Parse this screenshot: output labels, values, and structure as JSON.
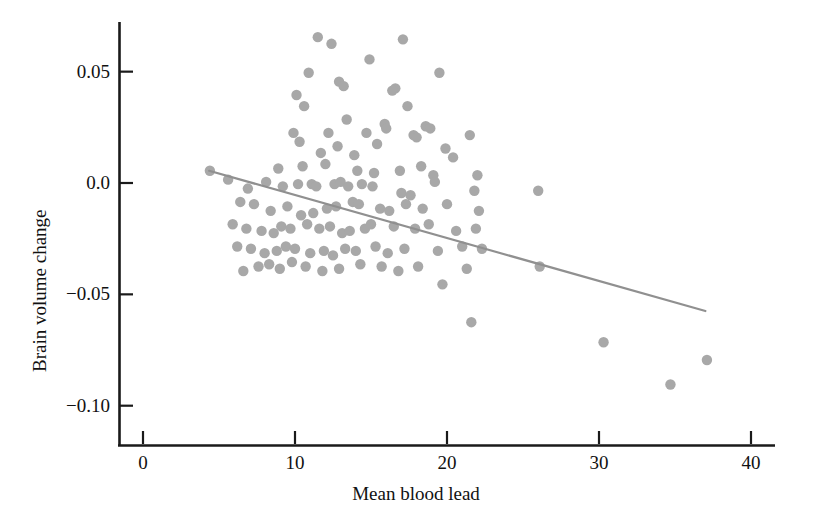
{
  "chart_data": {
    "type": "scatter",
    "title": "",
    "xlabel": "Mean blood lead",
    "ylabel": "Brain volume change",
    "xlim": [
      -1.5,
      42.5
    ],
    "ylim": [
      -0.112,
      0.072
    ],
    "xticks": [
      0,
      10,
      20,
      30,
      40
    ],
    "xtick_labels": [
      "0",
      "10",
      "20",
      "30",
      "40"
    ],
    "yticks": [
      0.05,
      0.0,
      -0.05,
      -0.1
    ],
    "ytick_labels": [
      "0.05",
      "0.0",
      "−0.05",
      "−0.10"
    ],
    "grid": false,
    "legend": null,
    "marker_color": "#a8a8a8",
    "marker_size": 5.2,
    "axis_color": "#1a1a1a",
    "fit_line": {
      "name": "linear regression",
      "color": "#909090",
      "width": 2.2,
      "x_start": 4.35,
      "y_start": 0.0055,
      "x_end": 37.0,
      "y_end": -0.0575
    },
    "x": [
      11.5,
      12.4,
      14.9,
      17.1,
      10.9,
      19.5,
      10.1,
      12.9,
      13.2,
      16.6,
      16.4,
      17.4,
      10.6,
      13.4,
      15.9,
      16.0,
      9.9,
      12.2,
      14.7,
      18.6,
      18.9,
      21.5,
      10.3,
      12.8,
      15.4,
      17.8,
      18.0,
      11.7,
      13.9,
      19.9,
      20.4,
      8.9,
      10.5,
      12.0,
      14.1,
      15.2,
      16.9,
      18.3,
      19.1,
      22.0,
      4.4,
      5.6,
      6.9,
      8.1,
      9.2,
      10.2,
      11.1,
      11.4,
      12.6,
      13.0,
      13.5,
      14.4,
      15.1,
      17.0,
      17.6,
      19.2,
      21.8,
      6.4,
      7.3,
      8.4,
      9.5,
      10.4,
      11.2,
      12.1,
      12.7,
      13.8,
      14.2,
      15.6,
      16.2,
      17.3,
      18.4,
      20.0,
      22.1,
      26.0,
      5.9,
      6.8,
      7.8,
      8.6,
      9.1,
      9.7,
      10.8,
      11.6,
      12.3,
      13.1,
      13.6,
      14.6,
      15.0,
      16.5,
      17.9,
      18.8,
      20.6,
      21.9,
      6.2,
      7.1,
      8.0,
      8.8,
      9.4,
      10.0,
      11.0,
      11.9,
      12.5,
      13.3,
      14.0,
      15.3,
      16.1,
      17.2,
      19.4,
      21.0,
      22.3,
      6.6,
      7.6,
      8.3,
      9.0,
      9.8,
      10.7,
      11.8,
      12.9,
      14.3,
      15.7,
      16.8,
      18.1,
      19.7,
      21.3,
      21.6,
      26.1,
      30.3,
      34.7,
      37.1
    ],
    "y": [
      0.0655,
      0.0625,
      0.0555,
      0.0645,
      0.0495,
      0.0495,
      0.0395,
      0.0455,
      0.0435,
      0.0425,
      0.0415,
      0.0345,
      0.0345,
      0.0285,
      0.0265,
      0.0245,
      0.0225,
      0.0225,
      0.0225,
      0.0255,
      0.0245,
      0.0215,
      0.0185,
      0.0165,
      0.0175,
      0.0215,
      0.0205,
      0.0135,
      0.0125,
      0.0155,
      0.0115,
      0.0065,
      0.0075,
      0.0085,
      0.0055,
      0.0045,
      0.0055,
      0.0075,
      0.0035,
      0.0035,
      0.0055,
      0.0015,
      -0.0025,
      0.0005,
      -0.0015,
      -0.0005,
      -0.0005,
      -0.0015,
      -0.0005,
      0.0005,
      -0.0015,
      -0.0005,
      -0.0015,
      -0.0045,
      -0.0055,
      0.0005,
      -0.0035,
      -0.0085,
      -0.0095,
      -0.0125,
      -0.0105,
      -0.0145,
      -0.0135,
      -0.0115,
      -0.0105,
      -0.0085,
      -0.0095,
      -0.0115,
      -0.0125,
      -0.0095,
      -0.0115,
      -0.0095,
      -0.0125,
      -0.0035,
      -0.0185,
      -0.0205,
      -0.0215,
      -0.0225,
      -0.0195,
      -0.0205,
      -0.0185,
      -0.0205,
      -0.0195,
      -0.0225,
      -0.0215,
      -0.0205,
      -0.0185,
      -0.0195,
      -0.0205,
      -0.0185,
      -0.0215,
      -0.0205,
      -0.0285,
      -0.0295,
      -0.0315,
      -0.0305,
      -0.0285,
      -0.0295,
      -0.0315,
      -0.0305,
      -0.0325,
      -0.0295,
      -0.0305,
      -0.0285,
      -0.0315,
      -0.0295,
      -0.0305,
      -0.0285,
      -0.0295,
      -0.0395,
      -0.0375,
      -0.0365,
      -0.0385,
      -0.0355,
      -0.0375,
      -0.0395,
      -0.0385,
      -0.0365,
      -0.0375,
      -0.0395,
      -0.0375,
      -0.0455,
      -0.0385,
      -0.0625,
      -0.0375,
      -0.0715,
      -0.0905,
      -0.0795
    ]
  }
}
